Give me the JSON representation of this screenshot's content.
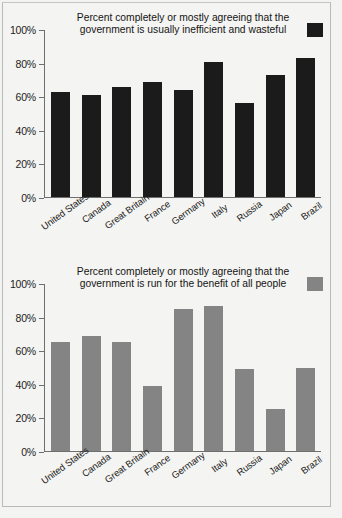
{
  "page": {
    "background_color": "#f4f4f2",
    "frame_color": "#b9b9b6"
  },
  "chart_data": [
    {
      "id": "inefficient-wasteful",
      "type": "bar",
      "title": "Percent completely or mostly agreeing that the government is usually inefficient and wasteful",
      "title_line1": "Percent completely or mostly agreeing that the",
      "title_line2": "government is usually inefficient and wasteful",
      "legend": {
        "position": "top-right",
        "entries": [
          {
            "label": "Percent completely or mostly agreeing that the government is usually inefficient and wasteful",
            "color": "#1c1b1b"
          }
        ]
      },
      "series_color": "#1c1b1b",
      "xlabel": "",
      "ylabel": "",
      "ylim": [
        0,
        100
      ],
      "yticks": [
        "0%",
        "20%",
        "40%",
        "60%",
        "80%",
        "100%"
      ],
      "ytick_values": [
        0,
        20,
        40,
        60,
        80,
        100
      ],
      "grid": false,
      "categories": [
        "United States",
        "Canada",
        "Great Britain",
        "France",
        "Germany",
        "Italy",
        "Russia",
        "Japan",
        "Brazil"
      ],
      "values": [
        63,
        61,
        66,
        69,
        64,
        81,
        56,
        73,
        83
      ]
    },
    {
      "id": "benefit-of-all-people",
      "type": "bar",
      "title": "Percent completely or mostly agreeing that the government is run for the benefit of all people",
      "title_line1": "Percent completely or mostly agreeing that the",
      "title_line2": "government is run for the benefit of all people",
      "legend": {
        "position": "top-right",
        "entries": [
          {
            "label": "Percent completely or mostly agreeing that the government is run for the benefit of all people",
            "color": "#848484"
          }
        ]
      },
      "series_color": "#848484",
      "xlabel": "",
      "ylabel": "",
      "ylim": [
        0,
        100
      ],
      "yticks": [
        "0%",
        "20%",
        "40%",
        "60%",
        "80%",
        "100%"
      ],
      "ytick_values": [
        0,
        20,
        40,
        60,
        80,
        100
      ],
      "grid": false,
      "categories": [
        "United States",
        "Canada",
        "Great Britain",
        "France",
        "Germany",
        "Italy",
        "Russia",
        "Japan",
        "Brazil"
      ],
      "values": [
        65,
        69,
        65,
        39,
        85,
        87,
        49,
        25,
        50
      ]
    }
  ]
}
